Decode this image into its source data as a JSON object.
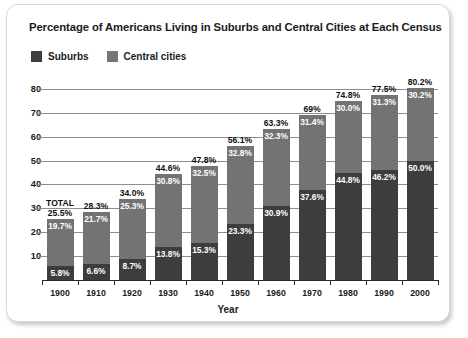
{
  "chart_data": {
    "type": "bar",
    "subtype": "stacked-bar",
    "title": "Percentage of Americans Living in Suburbs and Central Cities at Each Census",
    "xlabel": "Year",
    "ylabel": "",
    "ylim": [
      0,
      85
    ],
    "yticks": [
      10,
      20,
      30,
      40,
      50,
      60,
      70,
      80
    ],
    "grid": true,
    "legend_position": "top-left",
    "total_annotation": "TOTAL",
    "categories": [
      "1900",
      "1910",
      "1920",
      "1930",
      "1940",
      "1950",
      "1960",
      "1970",
      "1980",
      "1990",
      "2000"
    ],
    "series": [
      {
        "name": "Suburbs",
        "color": "#3d3d3d",
        "values": [
          5.8,
          6.6,
          8.7,
          13.8,
          15.3,
          23.3,
          30.9,
          37.6,
          44.8,
          46.2,
          50.0
        ],
        "labels": [
          "5.8%",
          "6.6%",
          "8.7%",
          "13.8%",
          "15.3%",
          "23.3%",
          "30.9%",
          "37.6%",
          "44.8%",
          "46.2%",
          "50.0%"
        ]
      },
      {
        "name": "Central cities",
        "color": "#737373",
        "values": [
          19.7,
          21.7,
          25.3,
          30.8,
          32.5,
          32.8,
          32.3,
          31.4,
          30.0,
          31.3,
          30.2
        ],
        "labels": [
          "19.7%",
          "21.7%",
          "25.3%",
          "30.8%",
          "32.5%",
          "32.8%",
          "32.3%",
          "31.4%",
          "30.0%",
          "31.3%",
          "30.2%"
        ]
      }
    ],
    "totals": [
      25.5,
      28.3,
      34.0,
      44.6,
      47.8,
      56.1,
      63.3,
      69.0,
      74.8,
      77.5,
      80.2
    ],
    "total_labels": [
      "25.5%",
      "28.3%",
      "34.0%",
      "44.6%",
      "47.8%",
      "56.1%",
      "63.3%",
      "69%",
      "74.8%",
      "77.5%",
      "80.2%"
    ]
  },
  "legend": {
    "items": [
      {
        "label": "Suburbs",
        "color": "#3d3d3d"
      },
      {
        "label": "Central cities",
        "color": "#737373"
      }
    ]
  }
}
